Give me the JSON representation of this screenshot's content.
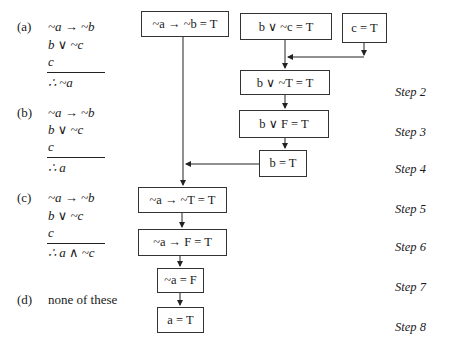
{
  "options": [
    {
      "label": "(a)",
      "premises": [
        "~a → ~b",
        "b ∨ ~c",
        "c"
      ],
      "conclusion": "∴ ~a"
    },
    {
      "label": "(b)",
      "premises": [
        "~a → ~b",
        "b ∨ ~c",
        "c"
      ],
      "conclusion": "∴ a"
    },
    {
      "label": "(c)",
      "premises": [
        "~a → ~b",
        "b ∨ ~c",
        "c"
      ],
      "conclusion": "∴ a ∧ ~c"
    },
    {
      "label": "(d)",
      "text": "none of these"
    }
  ],
  "boxes": {
    "premise1": "~a → ~b = T",
    "premise2": "b ∨ ~c = T",
    "premise3": "c = T",
    "step2": "b ∨ ~T = T",
    "step3": "b ∨ F = T",
    "step4": "b = T",
    "step5": "~a → ~T = T",
    "step6": "~a → F = T",
    "step7": "~a = F",
    "step8": "a = T"
  },
  "steps": [
    "Step 2",
    "Step 3",
    "Step 4",
    "Step 5",
    "Step 6",
    "Step 7",
    "Step 8"
  ]
}
